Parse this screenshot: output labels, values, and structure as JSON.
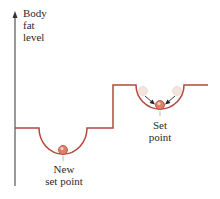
{
  "axis": {
    "y_label_lines": [
      "Body",
      "fat",
      "level"
    ]
  },
  "labels": {
    "new_set_point": [
      "New",
      "set point"
    ],
    "set_point": [
      "Set",
      "point"
    ]
  },
  "colors": {
    "curve": "#b5483a",
    "axis": "#333333",
    "ball": "#d9826a",
    "ghost_ball": "#f3e0d8",
    "arrow": "#222222"
  }
}
